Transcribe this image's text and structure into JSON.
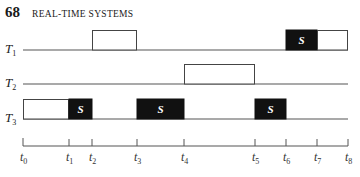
{
  "header": {
    "page_number": "68",
    "running_head": "REAL-TIME SYSTEMS"
  },
  "figure": {
    "type": "gantt-timeline",
    "colors": {
      "line": "#555555",
      "box_stroke": "#444444",
      "critical": "#111111",
      "critical_text": "#ffffff"
    },
    "axis": {
      "ticks": [
        {
          "label": "t",
          "sub": "0",
          "x": 23
        },
        {
          "label": "t",
          "sub": "1",
          "x": 69
        },
        {
          "label": "t",
          "sub": "2",
          "x": 92
        },
        {
          "label": "t",
          "sub": "3",
          "x": 137
        },
        {
          "label": "t",
          "sub": "4",
          "x": 184
        },
        {
          "label": "t",
          "sub": "5",
          "x": 255
        },
        {
          "label": "t",
          "sub": "6",
          "x": 286
        },
        {
          "label": "t",
          "sub": "7",
          "x": 317
        },
        {
          "label": "t",
          "sub": "8",
          "x": 348
        }
      ]
    },
    "tasks": [
      {
        "name": "T",
        "sub": "1",
        "baseline_y": 50,
        "segments": [
          {
            "from": "t2",
            "to": "t3",
            "kind": "normal",
            "label": ""
          },
          {
            "from": "t6",
            "to": "t7",
            "kind": "critical",
            "label": "S"
          },
          {
            "from": "t7",
            "to": "t8",
            "kind": "normal",
            "label": ""
          }
        ]
      },
      {
        "name": "T",
        "sub": "2",
        "baseline_y": 84,
        "segments": [
          {
            "from": "t4",
            "to": "t5",
            "kind": "normal",
            "label": ""
          }
        ]
      },
      {
        "name": "T",
        "sub": "3",
        "baseline_y": 119,
        "segments": [
          {
            "from": "t0",
            "to": "t1",
            "kind": "normal",
            "label": ""
          },
          {
            "from": "t1",
            "to": "t2",
            "kind": "critical",
            "label": "S"
          },
          {
            "from": "t3",
            "to": "t4",
            "kind": "critical",
            "label": "S"
          },
          {
            "from": "t5",
            "to": "t6",
            "kind": "critical",
            "label": "S"
          }
        ]
      }
    ]
  }
}
